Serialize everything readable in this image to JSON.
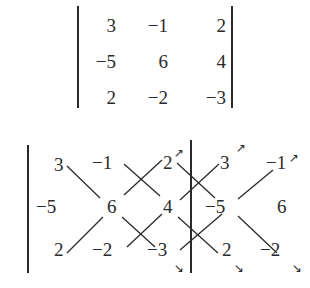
{
  "top_determinant": {
    "rows": [
      [
        "3",
        "−1",
        "2"
      ],
      [
        "−5",
        "6",
        "4"
      ],
      [
        "2",
        "−2",
        "−3"
      ]
    ]
  },
  "bottom_expansion": {
    "rows": [
      [
        "3",
        "−1",
        "2",
        "3",
        "−1"
      ],
      [
        "−5",
        "6",
        "4",
        "−5",
        "6"
      ],
      [
        "2",
        "−2",
        "−3",
        "2",
        "−2"
      ]
    ],
    "arrows": {
      "up": "↗",
      "down": "↘"
    }
  }
}
